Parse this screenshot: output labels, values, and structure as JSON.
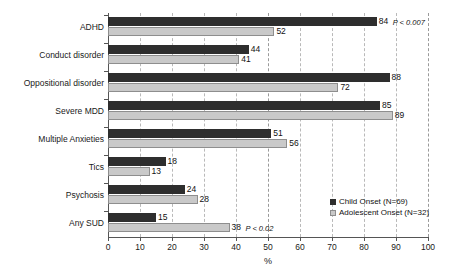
{
  "chart_data": {
    "type": "bar",
    "orientation": "horizontal",
    "title": "",
    "xlabel": "%",
    "ylabel": "",
    "xlim": [
      0,
      100
    ],
    "xticks": [
      0,
      10,
      20,
      30,
      40,
      50,
      60,
      70,
      80,
      90,
      100
    ],
    "grid": true,
    "grid_axis": "x",
    "legend_position": "right-bottom-inside",
    "categories": [
      "ADHD",
      "Conduct disorder",
      "Oppositional disorder",
      "Severe MDD",
      "Multiple Anxieties",
      "Tics",
      "Psychosis",
      "Any SUD"
    ],
    "series": [
      {
        "name": "Child Onset (N=69)",
        "color": "#2e2e2e",
        "values": [
          84,
          44,
          88,
          85,
          51,
          18,
          24,
          15
        ]
      },
      {
        "name": "Adolescent Onset (N=32)",
        "color": "#c9c9c9",
        "values": [
          52,
          41,
          72,
          89,
          56,
          13,
          28,
          38
        ]
      }
    ],
    "annotations": [
      {
        "category": "ADHD",
        "series": "Child Onset (N=69)",
        "text": "P < 0.007"
      },
      {
        "category": "Any SUD",
        "series": "Adolescent Onset (N=32)",
        "text": "P < 0.02"
      }
    ]
  },
  "legend": {
    "entries": [
      {
        "label": "Child Onset (N=69)"
      },
      {
        "label": "Adolescent Onset (N=32)"
      }
    ]
  },
  "axis": {
    "x_title": "%"
  }
}
